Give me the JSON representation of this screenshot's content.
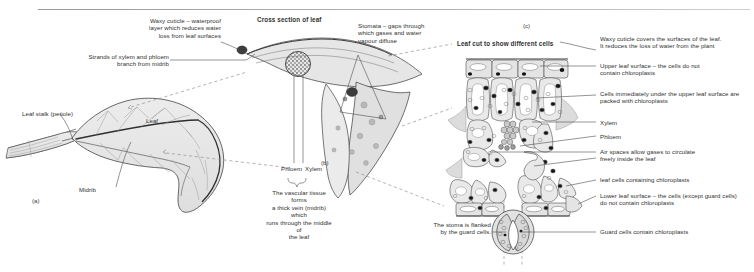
{
  "figure": {
    "title_cross_section": "Cross section of leaf",
    "title_leaf_cut": "Leaf cut to show different cells",
    "panel_a_id": "(a)",
    "panel_b_id": "(b)",
    "panel_c_id": "(c)"
  },
  "panel_a": {
    "leaf_stalk": "Leaf stalk (petiole)",
    "midrib": "Midrib",
    "leaf": "Leaf"
  },
  "panel_b": {
    "waxy_cuticle": "Waxy cuticle – waterproof\nlayer which reduces water\nloss from leaf surfaces",
    "strands": "Strands of xylem and phloem\nbranch from midrib",
    "stomata": "Stomata – gaps through\nwhich gases and water\nvapour diffuse",
    "phloem": "Phloem",
    "xylem": "Xylem",
    "vascular_tissue": "The vascular tissue forms\na thick vein (midrib) which\nruns through the middle of\nthe leaf"
  },
  "panel_c": {
    "waxy_cuticle": "Waxy cuticle covers the surfaces of the leaf.\nIt reduces the loss of water from the plant",
    "upper_leaf_surface": "Upper leaf surface – the cells do not\ncontain chloroplasts",
    "palisade": "Cells immediately under the upper leaf surface are\npacked with chloroplasts",
    "xylem": "Xylem",
    "phloem": "Phloem",
    "air_spaces": "Air spaces allow gases to circulate\nfreely inside the leaf",
    "leaf_cells": "leaf cells containing chloroplasts",
    "lower_leaf_surface": "Lower leaf surface – the cells (except guard cells)\ndo not contain chloroplasts",
    "stoma_flanked": "The stoma is flanked\nby the guard cells.",
    "guard_cells": "Guard cells contain chloroplasts"
  },
  "colors": {
    "ink": "#2b2b2b",
    "line": "#555555",
    "tissue_fill": "#e3e3e3",
    "tissue_fill_light": "#eeeeee",
    "vein_stipple": "#8a8a8a",
    "chloroplast": "#1a1a1a",
    "rule": "#9a9a9a"
  }
}
